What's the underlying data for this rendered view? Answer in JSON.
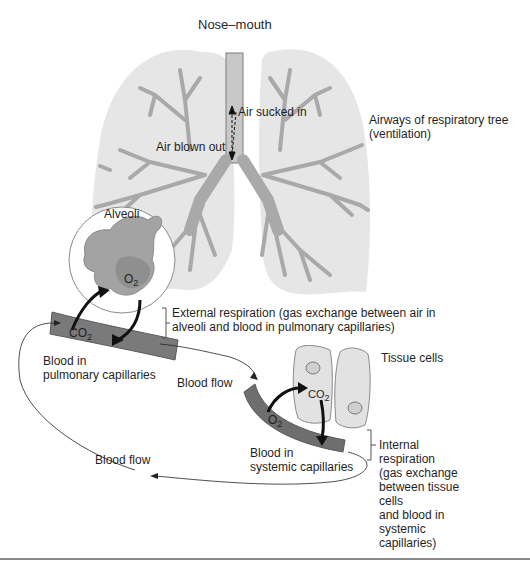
{
  "figure": {
    "colors": {
      "lung_fill": "#e6e6e6",
      "airway_fill": "#a9a9a9",
      "airway_stroke": "#7d7d7d",
      "trachea_fill": "#c8c8c8",
      "alveoli_fill": "#a3a3a3",
      "capillary_dark": "#6e6e6e",
      "capillary_light": "#8f8f8f",
      "cell_fill": "#e2e2e2",
      "cell_stroke": "#8a8a8a",
      "arrow": "#111111",
      "rule": "#8a8a8a"
    }
  },
  "labels": {
    "nose_mouth": "Nose–mouth",
    "air_sucked_in": "Air sucked in",
    "air_blown_out": "Air blown out",
    "airways_line1": "Airways of respiratory tree",
    "airways_line2": "(ventilation)",
    "alveoli": "Alveoli",
    "o2_alveoli": "O",
    "o2_alveoli_sub": "2",
    "co2_pulmonary": "CO",
    "co2_pulmonary_sub": "2",
    "external_line1": "External respiration (gas exchange between air in",
    "external_line2": "alveoli and blood in pulmonary capillaries)",
    "blood_pulmonary_line1": "Blood in",
    "blood_pulmonary_line2": "pulmonary capillaries",
    "blood_flow_upper": "Blood flow",
    "tissue_cells": "Tissue cells",
    "co2_tissue": "CO",
    "co2_tissue_sub": "2",
    "o2_systemic": "O",
    "o2_systemic_sub": "2",
    "blood_systemic_line1": "Blood in",
    "blood_systemic_line2": "systemic capillaries",
    "internal_lines": [
      "Internal",
      "respiration",
      "(gas exchange",
      "between tissue",
      "cells",
      "and blood in",
      "systemic",
      "capillaries)"
    ],
    "blood_flow_lower": "Blood flow"
  }
}
